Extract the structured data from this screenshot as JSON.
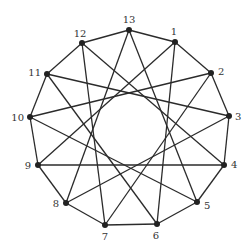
{
  "diagram": {
    "type": "circulant-graph",
    "colors": {
      "edge": "#2b2b2b",
      "node": "#222222",
      "label": "#333333",
      "background": "#ffffff"
    },
    "nodes": [
      {
        "id": "1",
        "x": 175,
        "y": 42,
        "lx": 174,
        "ly": 35,
        "anchor": "middle"
      },
      {
        "id": "2",
        "x": 211,
        "y": 73,
        "lx": 218,
        "ly": 75,
        "anchor": "start"
      },
      {
        "id": "3",
        "x": 229,
        "y": 116,
        "lx": 235,
        "ly": 120,
        "anchor": "start"
      },
      {
        "id": "4",
        "x": 224,
        "y": 165,
        "lx": 231,
        "ly": 168,
        "anchor": "start"
      },
      {
        "id": "5",
        "x": 197,
        "y": 202,
        "lx": 204,
        "ly": 209,
        "anchor": "start"
      },
      {
        "id": "6",
        "x": 157,
        "y": 224,
        "lx": 156,
        "ly": 239,
        "anchor": "middle"
      },
      {
        "id": "7",
        "x": 105,
        "y": 225,
        "lx": 105,
        "ly": 240,
        "anchor": "middle"
      },
      {
        "id": "8",
        "x": 66,
        "y": 203,
        "lx": 59,
        "ly": 207,
        "anchor": "end"
      },
      {
        "id": "9",
        "x": 38,
        "y": 165,
        "lx": 31,
        "ly": 169,
        "anchor": "end"
      },
      {
        "id": "10",
        "x": 30,
        "y": 117,
        "lx": 24,
        "ly": 121,
        "anchor": "end"
      },
      {
        "id": "11",
        "x": 47,
        "y": 74,
        "lx": 41,
        "ly": 76,
        "anchor": "end"
      },
      {
        "id": "12",
        "x": 82,
        "y": 43,
        "lx": 80,
        "ly": 37,
        "anchor": "middle"
      },
      {
        "id": "13",
        "x": 129,
        "y": 30,
        "lx": 129,
        "ly": 23,
        "anchor": "middle"
      }
    ],
    "edges": [
      [
        "1",
        "2"
      ],
      [
        "2",
        "3"
      ],
      [
        "3",
        "4"
      ],
      [
        "4",
        "5"
      ],
      [
        "5",
        "6"
      ],
      [
        "6",
        "7"
      ],
      [
        "7",
        "8"
      ],
      [
        "8",
        "9"
      ],
      [
        "9",
        "10"
      ],
      [
        "10",
        "11"
      ],
      [
        "11",
        "12"
      ],
      [
        "12",
        "13"
      ],
      [
        "13",
        "1"
      ],
      [
        "1",
        "6"
      ],
      [
        "2",
        "7"
      ],
      [
        "3",
        "8"
      ],
      [
        "4",
        "9"
      ],
      [
        "5",
        "10"
      ],
      [
        "6",
        "11"
      ],
      [
        "7",
        "12"
      ],
      [
        "8",
        "13"
      ],
      [
        "9",
        "1"
      ],
      [
        "10",
        "2"
      ],
      [
        "11",
        "3"
      ],
      [
        "12",
        "4"
      ],
      [
        "13",
        "5"
      ]
    ]
  }
}
